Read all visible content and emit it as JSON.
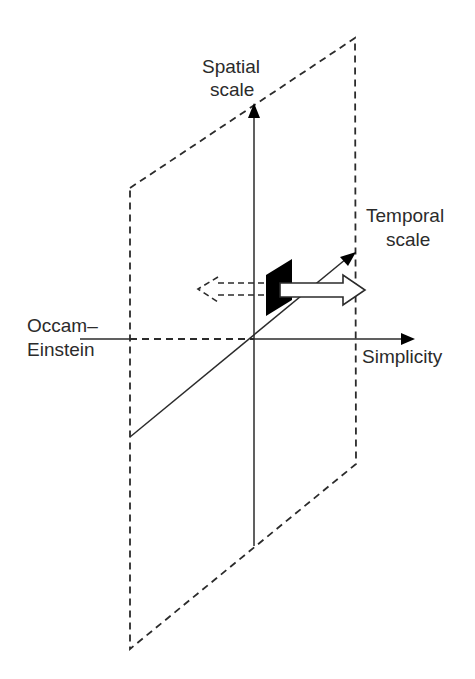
{
  "diagram": {
    "type": "3d-axes-with-plane",
    "colors": {
      "line": "#2b2b2b",
      "text": "#2b2b2b",
      "background": "#ffffff",
      "fill_dark": "#000000",
      "arrow_fill": "#ffffff"
    },
    "axes": {
      "spatial": {
        "label_line1": "Spatial",
        "label_line2": "scale",
        "direction": "up"
      },
      "temporal": {
        "label_line1": "Temporal",
        "label_line2": "scale",
        "direction": "diagonal"
      },
      "simplicity": {
        "label": "Simplicity",
        "direction": "right"
      },
      "occam_einstein": {
        "label_line1": "Occam–",
        "label_line2": "Einstein",
        "direction": "left"
      }
    },
    "plane": {
      "style": "dashed",
      "description": "parallelogram plane"
    },
    "markers": {
      "block": "black parallelogram",
      "forward_arrow": "white outlined arrow pointing right",
      "backward_arrow": "dashed arrow pointing left"
    }
  }
}
